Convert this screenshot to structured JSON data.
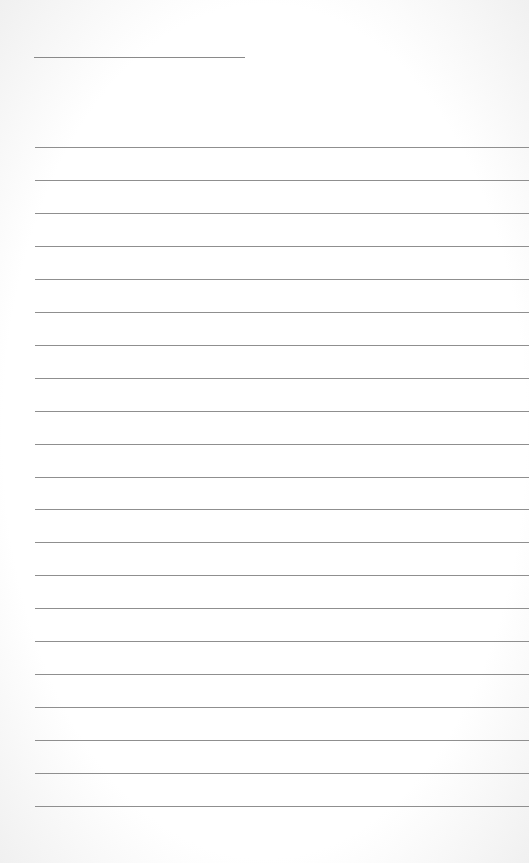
{
  "page": {
    "type": "lined-paper",
    "title_line": {
      "x": 34,
      "y": 57,
      "width": 211
    },
    "rules": {
      "start_y": 147,
      "spacing": 32.95,
      "count": 21,
      "left": 35
    },
    "colors": {
      "background": "#ffffff",
      "line": "#8f8f8f"
    }
  }
}
